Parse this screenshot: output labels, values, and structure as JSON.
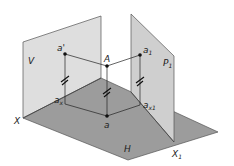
{
  "diagram": {
    "planes": [
      {
        "id": "V",
        "label": "V",
        "description": "vertical projection plane"
      },
      {
        "id": "H",
        "label": "H",
        "description": "horizontal projection plane"
      },
      {
        "id": "P1",
        "label": "P",
        "label_sub": "1",
        "description": "auxiliary projection plane"
      }
    ],
    "axes": [
      {
        "id": "X",
        "label": "X"
      },
      {
        "id": "X1",
        "label": "X",
        "label_sub": "1"
      }
    ],
    "points": [
      {
        "id": "A",
        "label": "A",
        "description": "space point"
      },
      {
        "id": "a_prime",
        "label": "a'",
        "description": "projection on V"
      },
      {
        "id": "a",
        "label": "a",
        "description": "projection on H"
      },
      {
        "id": "a1",
        "label": "a",
        "label_sub": "1",
        "description": "projection on P1"
      },
      {
        "id": "ax",
        "label": "a",
        "label_sub": "x",
        "description": "projection onto X axis"
      },
      {
        "id": "ax1",
        "label": "a",
        "label_sub": "x1",
        "description": "projection onto X1 axis"
      }
    ],
    "equal_distance_marks": [
      "a'-ax",
      "A-a",
      "a1-ax1"
    ],
    "colors": {
      "plane_v": "#dedede",
      "plane_h": "#9c9c9c",
      "plane_p1": "#cfcfcf",
      "edge": "#444444",
      "point": "#111111"
    }
  }
}
